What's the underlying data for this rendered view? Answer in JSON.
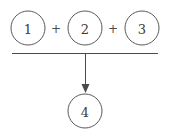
{
  "diagram": {
    "background_color": "#ffffff",
    "stroke_color": "#5a5a5a",
    "text_color": "#3c3c3c",
    "width": 170,
    "height": 133,
    "operands": [
      {
        "label": "1",
        "cx": 28,
        "cy": 28,
        "r": 17
      },
      {
        "label": "2",
        "cx": 85,
        "cy": 28,
        "r": 17
      },
      {
        "label": "3",
        "cx": 142,
        "cy": 28,
        "r": 17
      }
    ],
    "operators": [
      {
        "label": "+",
        "x": 56,
        "y": 28
      },
      {
        "label": "+",
        "x": 113,
        "y": 28
      }
    ],
    "rule": {
      "x1": 12,
      "y1": 53,
      "x2": 158,
      "y2": 53
    },
    "arrow": {
      "x": 85,
      "y1": 53,
      "y2": 93
    },
    "result": {
      "label": "4",
      "cx": 85,
      "cy": 111,
      "r": 17
    }
  }
}
